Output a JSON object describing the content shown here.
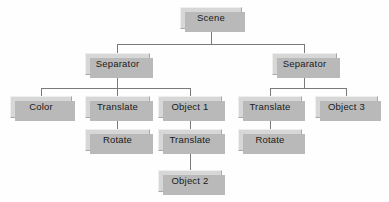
{
  "diagram": {
    "type": "scene-graph-tree",
    "background_color": "#fefefe",
    "node_fill_color": "#d7d7d7",
    "node_shadow_color": "#b9b9b9",
    "line_color": "#7a7a7a",
    "text_color": "#1a1a1a",
    "nodes": [
      {
        "id": "scene",
        "label": "Scene",
        "x": 180,
        "y": 7,
        "w": 62,
        "h": 22,
        "level": 0
      },
      {
        "id": "separator-l",
        "label": "Separator",
        "x": 85,
        "y": 53,
        "w": 65,
        "h": 22,
        "level": 1
      },
      {
        "id": "separator-r",
        "label": "Separator",
        "x": 272,
        "y": 53,
        "w": 65,
        "h": 22,
        "level": 1
      },
      {
        "id": "color",
        "label": "Color",
        "x": 10,
        "y": 96,
        "w": 62,
        "h": 22,
        "level": 2
      },
      {
        "id": "translate-1",
        "label": "Translate",
        "x": 85,
        "y": 96,
        "w": 65,
        "h": 22,
        "level": 2
      },
      {
        "id": "object-1",
        "label": "Object 1",
        "x": 158,
        "y": 96,
        "w": 64,
        "h": 22,
        "level": 2
      },
      {
        "id": "translate-2",
        "label": "Translate",
        "x": 238,
        "y": 96,
        "w": 64,
        "h": 22,
        "level": 2
      },
      {
        "id": "object-3",
        "label": "Object 3",
        "x": 315,
        "y": 96,
        "w": 63,
        "h": 22,
        "level": 2
      },
      {
        "id": "rotate-1",
        "label": "Rotate",
        "x": 85,
        "y": 129,
        "w": 65,
        "h": 22,
        "level": 3
      },
      {
        "id": "translate-3",
        "label": "Translate",
        "x": 158,
        "y": 129,
        "w": 64,
        "h": 22,
        "level": 3
      },
      {
        "id": "rotate-2",
        "label": "Rotate",
        "x": 238,
        "y": 129,
        "w": 64,
        "h": 22,
        "level": 3
      },
      {
        "id": "object-2",
        "label": "Object 2",
        "x": 158,
        "y": 170,
        "w": 64,
        "h": 22,
        "level": 4
      }
    ],
    "edges": [
      {
        "from": "scene",
        "to": "separator-l"
      },
      {
        "from": "scene",
        "to": "separator-r"
      },
      {
        "from": "separator-l",
        "to": "color"
      },
      {
        "from": "separator-l",
        "to": "translate-1"
      },
      {
        "from": "separator-l",
        "to": "object-1"
      },
      {
        "from": "separator-r",
        "to": "translate-2"
      },
      {
        "from": "separator-r",
        "to": "object-3"
      },
      {
        "from": "translate-1",
        "to": "rotate-1"
      },
      {
        "from": "object-1",
        "to": "translate-3"
      },
      {
        "from": "translate-2",
        "to": "rotate-2"
      },
      {
        "from": "translate-3",
        "to": "object-2"
      }
    ],
    "connectors": [
      {
        "name": "scene-trunk",
        "orient": "v",
        "x": 211,
        "y": 29,
        "len": 15
      },
      {
        "name": "scene-bus",
        "orient": "h",
        "x": 117,
        "y": 44,
        "len": 188
      },
      {
        "name": "scene-drop-left",
        "orient": "v",
        "x": 117,
        "y": 44,
        "len": 9
      },
      {
        "name": "scene-drop-right",
        "orient": "v",
        "x": 304,
        "y": 44,
        "len": 9
      },
      {
        "name": "sep-l-trunk",
        "orient": "v",
        "x": 117,
        "y": 75,
        "len": 13
      },
      {
        "name": "sep-l-bus",
        "orient": "h",
        "x": 41,
        "y": 88,
        "len": 149
      },
      {
        "name": "sep-l-drop-color",
        "orient": "v",
        "x": 41,
        "y": 88,
        "len": 8
      },
      {
        "name": "sep-l-drop-trans",
        "orient": "v",
        "x": 117,
        "y": 88,
        "len": 8
      },
      {
        "name": "sep-l-drop-obj1",
        "orient": "v",
        "x": 190,
        "y": 88,
        "len": 8
      },
      {
        "name": "sep-r-trunk",
        "orient": "v",
        "x": 304,
        "y": 75,
        "len": 13
      },
      {
        "name": "sep-r-bus",
        "orient": "h",
        "x": 270,
        "y": 88,
        "len": 77
      },
      {
        "name": "sep-r-drop-trans",
        "orient": "v",
        "x": 270,
        "y": 88,
        "len": 8
      },
      {
        "name": "sep-r-drop-obj3",
        "orient": "v",
        "x": 346,
        "y": 88,
        "len": 8
      },
      {
        "name": "trans1-to-rotate1",
        "orient": "v",
        "x": 117,
        "y": 118,
        "len": 11
      },
      {
        "name": "obj1-to-trans3",
        "orient": "v",
        "x": 190,
        "y": 118,
        "len": 11
      },
      {
        "name": "trans2-to-rotate2",
        "orient": "v",
        "x": 270,
        "y": 118,
        "len": 11
      },
      {
        "name": "trans3-to-obj2",
        "orient": "v",
        "x": 190,
        "y": 151,
        "len": 19
      }
    ]
  }
}
